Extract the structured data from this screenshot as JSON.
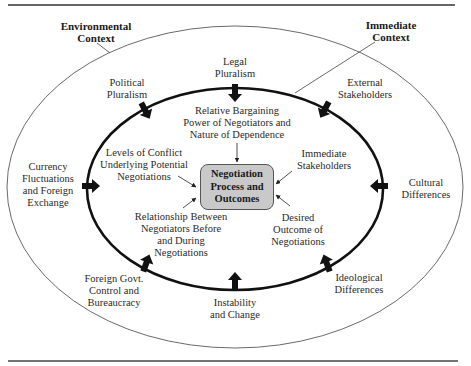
{
  "diagram": {
    "contexts": {
      "environmental": "Environmental\nContext",
      "immediate": "Immediate\nContext"
    },
    "center": "Negotiation\nProcess and\nOutcomes",
    "environmental_factors": [
      {
        "id": "legal",
        "label": "Legal\nPluralism",
        "arrow": "down"
      },
      {
        "id": "political",
        "label": "Political\nPluralism",
        "arrow": "down-right"
      },
      {
        "id": "external",
        "label": "External\nStakeholders",
        "arrow": "down-left"
      },
      {
        "id": "currency",
        "label": "Currency\nFluctuations\nand Foreign\nExchange",
        "arrow": "right"
      },
      {
        "id": "cultural",
        "label": "Cultural\nDifferences",
        "arrow": "left"
      },
      {
        "id": "foreign-govt",
        "label": "Foreign Govt.\nControl and\nBureaucracy",
        "arrow": "up-right"
      },
      {
        "id": "instability",
        "label": "Instability\nand Change",
        "arrow": "up"
      },
      {
        "id": "ideological",
        "label": "Ideological\nDifferences",
        "arrow": "up-left"
      }
    ],
    "immediate_factors": [
      {
        "id": "bargaining",
        "label": "Relative Bargaining\nPower of Negotiators and\nNature of Dependence"
      },
      {
        "id": "conflict",
        "label": "Levels of Conflict\nUnderlying Potential\nNegotiations"
      },
      {
        "id": "stakeholders",
        "label": "Immediate\nStakeholders"
      },
      {
        "id": "relationship",
        "label": "Relationship Between\nNegotiators Before\nand During\nNegotiations"
      },
      {
        "id": "desired",
        "label": "Desired\nOutcome of\nNegotiations"
      }
    ],
    "colors": {
      "center_fill": "#c9c9c9",
      "line": "#1a1a1a",
      "text": "#2a2a2a"
    }
  }
}
